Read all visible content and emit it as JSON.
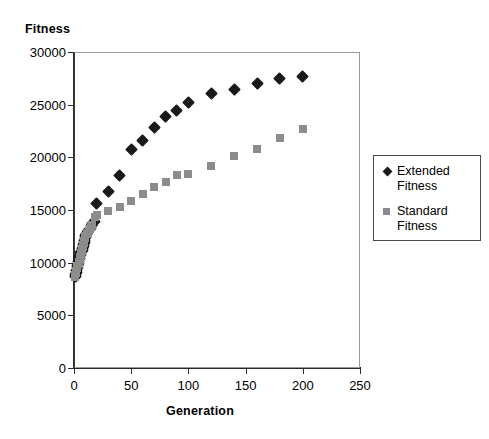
{
  "chart_data": {
    "type": "scatter",
    "title": "",
    "xlabel": "Generation",
    "ylabel": "Fitness",
    "xlim": [
      0,
      250
    ],
    "ylim": [
      0,
      30000
    ],
    "xticks": [
      0,
      50,
      100,
      150,
      200,
      250
    ],
    "yticks": [
      0,
      5000,
      10000,
      15000,
      20000,
      25000,
      30000
    ],
    "xtick_labels": [
      "0",
      "50",
      "100",
      "150",
      "200",
      "250"
    ],
    "ytick_labels": [
      "0",
      "5000",
      "10000",
      "15000",
      "20000",
      "25000",
      "30000"
    ],
    "grid": false,
    "legend_position": "right",
    "series": [
      {
        "name": "Extended Fitness",
        "marker": "diamond",
        "color": "#1a1a1a",
        "points": [
          [
            1,
            8700
          ],
          [
            1,
            8900
          ],
          [
            2,
            9100
          ],
          [
            2,
            9300
          ],
          [
            3,
            9500
          ],
          [
            3,
            9700
          ],
          [
            4,
            9900
          ],
          [
            4,
            10100
          ],
          [
            5,
            10350
          ],
          [
            5,
            10550
          ],
          [
            6,
            10750
          ],
          [
            6,
            10950
          ],
          [
            7,
            11150
          ],
          [
            7,
            11350
          ],
          [
            8,
            11550
          ],
          [
            8,
            11750
          ],
          [
            9,
            11950
          ],
          [
            9,
            12150
          ],
          [
            10,
            12350
          ],
          [
            10,
            12550
          ],
          [
            11,
            12750
          ],
          [
            12,
            12900
          ],
          [
            13,
            13050
          ],
          [
            14,
            13250
          ],
          [
            15,
            13550
          ],
          [
            16,
            13750
          ],
          [
            18,
            13900
          ],
          [
            20,
            15600
          ],
          [
            30,
            16800
          ],
          [
            40,
            18300
          ],
          [
            50,
            20700
          ],
          [
            60,
            21600
          ],
          [
            70,
            22800
          ],
          [
            80,
            23900
          ],
          [
            90,
            24400
          ],
          [
            100,
            25200
          ],
          [
            120,
            26100
          ],
          [
            140,
            26400
          ],
          [
            160,
            27000
          ],
          [
            180,
            27500
          ],
          [
            200,
            27700
          ]
        ]
      },
      {
        "name": "Standard Fitness",
        "marker": "square",
        "color": "#8c8c8c",
        "points": [
          [
            1,
            8650
          ],
          [
            1,
            8850
          ],
          [
            2,
            9050
          ],
          [
            2,
            9250
          ],
          [
            3,
            9450
          ],
          [
            3,
            9650
          ],
          [
            4,
            9850
          ],
          [
            4,
            10050
          ],
          [
            5,
            10300
          ],
          [
            5,
            10500
          ],
          [
            6,
            10700
          ],
          [
            6,
            10900
          ],
          [
            7,
            11100
          ],
          [
            7,
            11300
          ],
          [
            8,
            11500
          ],
          [
            8,
            11700
          ],
          [
            9,
            11900
          ],
          [
            9,
            12100
          ],
          [
            10,
            12300
          ],
          [
            10,
            12500
          ],
          [
            11,
            12700
          ],
          [
            12,
            12850
          ],
          [
            13,
            13000
          ],
          [
            14,
            13200
          ],
          [
            15,
            13400
          ],
          [
            16,
            13600
          ],
          [
            18,
            14350
          ],
          [
            20,
            14500
          ],
          [
            30,
            14900
          ],
          [
            40,
            15300
          ],
          [
            50,
            15900
          ],
          [
            60,
            16500
          ],
          [
            70,
            17200
          ],
          [
            80,
            17700
          ],
          [
            90,
            18300
          ],
          [
            100,
            18400
          ],
          [
            120,
            19200
          ],
          [
            140,
            20100
          ],
          [
            160,
            20800
          ],
          [
            180,
            21800
          ],
          [
            200,
            22700
          ]
        ]
      }
    ]
  },
  "axes": {
    "y_title": "Fitness",
    "x_title": "Generation"
  },
  "legend": {
    "entries": [
      {
        "label": "Extended\nFitness",
        "marker": "diamond-marker"
      },
      {
        "label": "Standard\nFitness",
        "marker": "square-marker"
      }
    ]
  }
}
